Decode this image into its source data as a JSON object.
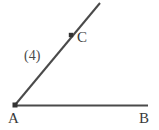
{
  "figure": {
    "background_color": "#ffffff",
    "stroke_color": "#4a4a4a",
    "marker_color": "#333333",
    "label_color": "#3a3a3a",
    "width": 159,
    "height": 130
  },
  "labels": {
    "vertex": "A",
    "ray_horizontal_end": "B",
    "ray_diagonal_point": "C",
    "measure": "(4)"
  },
  "geometry": {
    "vertex_point": {
      "x": 15,
      "y": 105
    },
    "point_b": {
      "x": 148,
      "y": 105
    },
    "point_c_marker": {
      "x": 71,
      "y": 35
    },
    "ray_diagonal_end": {
      "x": 100,
      "y": 3
    }
  }
}
